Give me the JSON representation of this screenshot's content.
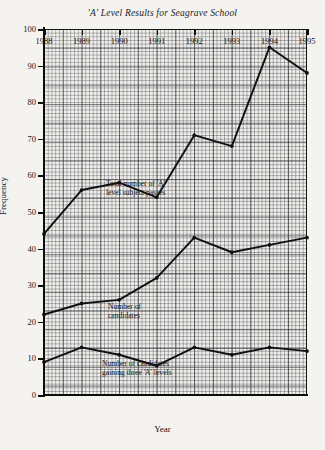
{
  "chart_data": {
    "type": "line",
    "title": "'A' Level Results for Seagrave School",
    "xlabel": "Year",
    "ylabel": "Frequency",
    "grid": true,
    "legend_position": "inline-annotations",
    "categories": [
      "1988",
      "1989",
      "1990",
      "1991",
      "1992",
      "1993",
      "1994",
      "1995"
    ],
    "xlim": [
      1988,
      1995
    ],
    "ylim": [
      0,
      100
    ],
    "ytick_labels": [
      "0",
      "10",
      "20",
      "30",
      "40",
      "50",
      "60",
      "70",
      "80",
      "90",
      "100"
    ],
    "yticks": [
      0,
      10,
      20,
      30,
      40,
      50,
      60,
      70,
      80,
      90,
      100
    ],
    "series": [
      {
        "name": "Total number of 'A' level subject passes",
        "annotation": "Total number of 'A'\nlevel subject passes",
        "values": [
          44,
          56,
          58,
          54,
          71,
          68,
          95,
          88
        ]
      },
      {
        "name": "Number of candidates",
        "annotation": "Number of\ncandidates",
        "values": [
          22,
          25,
          26,
          32,
          43,
          39,
          41,
          43
        ]
      },
      {
        "name": "Number of candidates gaining three 'A' levels",
        "annotation": "Number of candidates\ngaining three 'A' levels",
        "values": [
          9,
          13,
          11,
          8,
          13,
          11,
          13,
          12
        ]
      }
    ]
  }
}
